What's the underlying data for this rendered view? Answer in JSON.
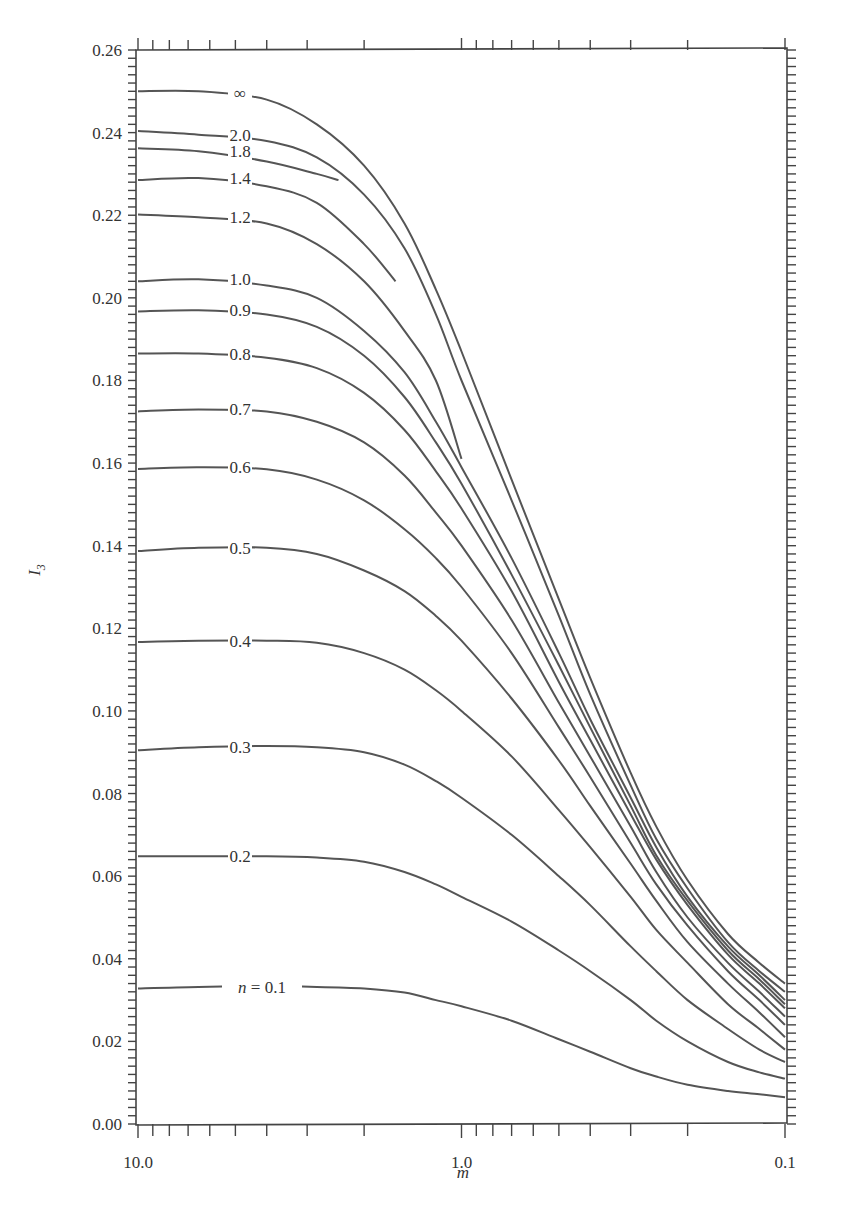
{
  "chart_data": {
    "type": "line",
    "title": "",
    "xlabel": "m",
    "ylabel": "I3",
    "xscale": "log",
    "x_reversed": true,
    "xlim": [
      10.0,
      0.1
    ],
    "ylim": [
      0.0,
      0.26
    ],
    "grid": false,
    "legend": "inline curve labels",
    "x_tick_labels": [
      "10.0",
      "1.0",
      "0.1"
    ],
    "y_tick_labels": [
      "0.00",
      "0.02",
      "0.04",
      "0.06",
      "0.08",
      "0.10",
      "0.12",
      "0.14",
      "0.16",
      "0.18",
      "0.20",
      "0.22",
      "0.24",
      "0.26"
    ],
    "series": [
      {
        "name": "∞",
        "label": "∞",
        "label_m": 6.0,
        "points": [
          [
            10,
            0.25
          ],
          [
            6.5,
            0.25
          ],
          [
            4.0,
            0.248
          ],
          [
            2.8,
            0.242
          ],
          [
            2.0,
            0.232
          ],
          [
            1.5,
            0.218
          ],
          [
            1.2,
            0.202
          ],
          [
            1.0,
            0.187
          ],
          [
            0.7,
            0.156
          ],
          [
            0.5,
            0.127
          ],
          [
            0.4,
            0.108
          ],
          [
            0.3,
            0.085
          ],
          [
            0.25,
            0.072
          ],
          [
            0.2,
            0.059
          ],
          [
            0.15,
            0.046
          ],
          [
            0.12,
            0.039
          ],
          [
            0.1,
            0.034
          ]
        ]
      },
      {
        "name": "2.0",
        "label": "2.0",
        "label_m": 6.0,
        "points": [
          [
            10,
            0.2404
          ],
          [
            6.5,
            0.2395
          ],
          [
            4.0,
            0.238
          ],
          [
            2.8,
            0.234
          ],
          [
            2.0,
            0.225
          ],
          [
            1.5,
            0.212
          ],
          [
            1.2,
            0.196
          ],
          [
            1.0,
            0.18
          ],
          [
            0.7,
            0.151
          ],
          [
            0.5,
            0.123
          ],
          [
            0.4,
            0.104
          ],
          [
            0.3,
            0.082
          ],
          [
            0.25,
            0.069
          ],
          [
            0.2,
            0.057
          ],
          [
            0.15,
            0.044
          ],
          [
            0.12,
            0.037
          ],
          [
            0.1,
            0.032
          ]
        ]
      },
      {
        "name": "1.8",
        "label": "1.8",
        "label_m": 6.0,
        "points": [
          [
            10,
            0.2362
          ],
          [
            6.5,
            0.2355
          ],
          [
            4.0,
            0.233
          ],
          [
            2.8,
            0.23
          ],
          [
            2.4,
            0.2285
          ]
        ]
      },
      {
        "name": "1.4",
        "label": "1.4",
        "label_m": 6.0,
        "points": [
          [
            10,
            0.2285
          ],
          [
            6.5,
            0.229
          ],
          [
            4.0,
            0.227
          ],
          [
            2.8,
            0.223
          ],
          [
            2.0,
            0.213
          ],
          [
            1.6,
            0.204
          ]
        ]
      },
      {
        "name": "1.2",
        "label": "1.2",
        "label_m": 6.0,
        "points": [
          [
            10,
            0.2202
          ],
          [
            6.5,
            0.2195
          ],
          [
            4.0,
            0.218
          ],
          [
            2.8,
            0.213
          ],
          [
            2.0,
            0.204
          ],
          [
            1.5,
            0.192
          ],
          [
            1.2,
            0.18
          ],
          [
            1.0,
            0.161
          ]
        ]
      },
      {
        "name": "1.0",
        "label": "1.0",
        "label_m": 6.0,
        "points": [
          [
            10,
            0.204
          ],
          [
            6.5,
            0.2045
          ],
          [
            4.0,
            0.203
          ],
          [
            2.8,
            0.2
          ],
          [
            2.0,
            0.192
          ],
          [
            1.5,
            0.182
          ],
          [
            1.2,
            0.17
          ],
          [
            1.0,
            0.159
          ],
          [
            0.7,
            0.137
          ],
          [
            0.5,
            0.114
          ],
          [
            0.4,
            0.098
          ],
          [
            0.3,
            0.079
          ],
          [
            0.25,
            0.067
          ],
          [
            0.2,
            0.055
          ],
          [
            0.15,
            0.043
          ],
          [
            0.12,
            0.036
          ],
          [
            0.1,
            0.03
          ]
        ]
      },
      {
        "name": "0.9",
        "label": "0.9",
        "label_m": 6.0,
        "points": [
          [
            10,
            0.1967
          ],
          [
            6.5,
            0.197
          ],
          [
            4.0,
            0.196
          ],
          [
            2.8,
            0.193
          ],
          [
            2.0,
            0.186
          ],
          [
            1.5,
            0.176
          ],
          [
            1.2,
            0.165
          ],
          [
            1.0,
            0.155
          ],
          [
            0.7,
            0.133
          ],
          [
            0.5,
            0.111
          ],
          [
            0.4,
            0.096
          ],
          [
            0.3,
            0.077
          ],
          [
            0.25,
            0.065
          ],
          [
            0.2,
            0.054
          ],
          [
            0.15,
            0.042
          ],
          [
            0.12,
            0.035
          ],
          [
            0.1,
            0.029
          ]
        ]
      },
      {
        "name": "0.8",
        "label": "0.8",
        "label_m": 6.0,
        "points": [
          [
            10,
            0.1865
          ],
          [
            6.5,
            0.1865
          ],
          [
            4.0,
            0.1855
          ],
          [
            2.8,
            0.183
          ],
          [
            2.0,
            0.177
          ],
          [
            1.5,
            0.168
          ],
          [
            1.2,
            0.158
          ],
          [
            1.0,
            0.149
          ],
          [
            0.7,
            0.129
          ],
          [
            0.5,
            0.107
          ],
          [
            0.4,
            0.093
          ],
          [
            0.3,
            0.075
          ],
          [
            0.25,
            0.064
          ],
          [
            0.2,
            0.053
          ],
          [
            0.15,
            0.041
          ],
          [
            0.12,
            0.034
          ],
          [
            0.1,
            0.028
          ]
        ]
      },
      {
        "name": "0.7",
        "label": "0.7",
        "label_m": 6.0,
        "points": [
          [
            10,
            0.1725
          ],
          [
            6.5,
            0.173
          ],
          [
            4.0,
            0.1725
          ],
          [
            2.8,
            0.17
          ],
          [
            2.0,
            0.165
          ],
          [
            1.5,
            0.157
          ],
          [
            1.2,
            0.148
          ],
          [
            1.0,
            0.14
          ],
          [
            0.7,
            0.122
          ],
          [
            0.5,
            0.102
          ],
          [
            0.4,
            0.089
          ],
          [
            0.3,
            0.072
          ],
          [
            0.25,
            0.061
          ],
          [
            0.2,
            0.05
          ],
          [
            0.15,
            0.039
          ],
          [
            0.12,
            0.032
          ],
          [
            0.1,
            0.026
          ]
        ]
      },
      {
        "name": "0.6",
        "label": "0.6",
        "label_m": 6.0,
        "points": [
          [
            10,
            0.1586
          ],
          [
            6.5,
            0.159
          ],
          [
            4.0,
            0.1585
          ],
          [
            2.8,
            0.156
          ],
          [
            2.0,
            0.151
          ],
          [
            1.5,
            0.144
          ],
          [
            1.2,
            0.137
          ],
          [
            1.0,
            0.13
          ],
          [
            0.7,
            0.114
          ],
          [
            0.5,
            0.096
          ],
          [
            0.4,
            0.084
          ],
          [
            0.3,
            0.068
          ],
          [
            0.25,
            0.058
          ],
          [
            0.2,
            0.048
          ],
          [
            0.15,
            0.037
          ],
          [
            0.12,
            0.03
          ],
          [
            0.1,
            0.024
          ]
        ]
      },
      {
        "name": "0.5",
        "label": "0.5",
        "label_m": 6.0,
        "points": [
          [
            10,
            0.1387
          ],
          [
            6.5,
            0.1395
          ],
          [
            4.0,
            0.1395
          ],
          [
            2.8,
            0.138
          ],
          [
            2.0,
            0.134
          ],
          [
            1.5,
            0.129
          ],
          [
            1.2,
            0.123
          ],
          [
            1.0,
            0.117
          ],
          [
            0.7,
            0.103
          ],
          [
            0.5,
            0.088
          ],
          [
            0.4,
            0.077
          ],
          [
            0.3,
            0.063
          ],
          [
            0.25,
            0.054
          ],
          [
            0.2,
            0.044
          ],
          [
            0.15,
            0.034
          ],
          [
            0.12,
            0.027
          ],
          [
            0.1,
            0.021
          ]
        ]
      },
      {
        "name": "0.4",
        "label": "0.4",
        "label_m": 6.0,
        "points": [
          [
            10,
            0.1167
          ],
          [
            6.5,
            0.117
          ],
          [
            4.0,
            0.117
          ],
          [
            2.8,
            0.1165
          ],
          [
            2.0,
            0.114
          ],
          [
            1.5,
            0.11
          ],
          [
            1.2,
            0.105
          ],
          [
            1.0,
            0.1
          ],
          [
            0.7,
            0.089
          ],
          [
            0.5,
            0.076
          ],
          [
            0.4,
            0.067
          ],
          [
            0.3,
            0.055
          ],
          [
            0.25,
            0.047
          ],
          [
            0.2,
            0.039
          ],
          [
            0.15,
            0.029
          ],
          [
            0.12,
            0.023
          ],
          [
            0.1,
            0.018
          ]
        ]
      },
      {
        "name": "0.3",
        "label": "0.3",
        "label_m": 6.0,
        "points": [
          [
            10,
            0.0905
          ],
          [
            6.5,
            0.0912
          ],
          [
            4.0,
            0.0915
          ],
          [
            2.8,
            0.0912
          ],
          [
            2.0,
            0.09
          ],
          [
            1.5,
            0.087
          ],
          [
            1.2,
            0.083
          ],
          [
            1.0,
            0.079
          ],
          [
            0.7,
            0.07
          ],
          [
            0.5,
            0.06
          ],
          [
            0.4,
            0.053
          ],
          [
            0.3,
            0.043
          ],
          [
            0.25,
            0.037
          ],
          [
            0.2,
            0.03
          ],
          [
            0.15,
            0.023
          ],
          [
            0.12,
            0.018
          ],
          [
            0.1,
            0.015
          ]
        ]
      },
      {
        "name": "0.2",
        "label": "0.2",
        "label_m": 6.0,
        "points": [
          [
            10,
            0.0648
          ],
          [
            6.5,
            0.0648
          ],
          [
            4.0,
            0.0648
          ],
          [
            2.8,
            0.0645
          ],
          [
            2.0,
            0.0635
          ],
          [
            1.5,
            0.061
          ],
          [
            1.2,
            0.058
          ],
          [
            1.0,
            0.055
          ],
          [
            0.7,
            0.049
          ],
          [
            0.5,
            0.042
          ],
          [
            0.4,
            0.037
          ],
          [
            0.3,
            0.03
          ],
          [
            0.25,
            0.025
          ],
          [
            0.2,
            0.02
          ],
          [
            0.15,
            0.015
          ],
          [
            0.12,
            0.0125
          ],
          [
            0.1,
            0.011
          ]
        ]
      },
      {
        "name": "n = 0.1",
        "label": "n = 0.1",
        "label_m": 6.0,
        "points": [
          [
            10,
            0.0328
          ],
          [
            6.5,
            0.0332
          ],
          [
            4.0,
            0.0333
          ],
          [
            2.8,
            0.0332
          ],
          [
            2.0,
            0.0328
          ],
          [
            1.5,
            0.0318
          ],
          [
            1.2,
            0.03
          ],
          [
            1.0,
            0.0285
          ],
          [
            0.7,
            0.025
          ],
          [
            0.5,
            0.0205
          ],
          [
            0.4,
            0.0175
          ],
          [
            0.3,
            0.0135
          ],
          [
            0.25,
            0.0115
          ],
          [
            0.2,
            0.0095
          ],
          [
            0.15,
            0.008
          ],
          [
            0.12,
            0.0072
          ],
          [
            0.1,
            0.0065
          ]
        ]
      }
    ]
  }
}
